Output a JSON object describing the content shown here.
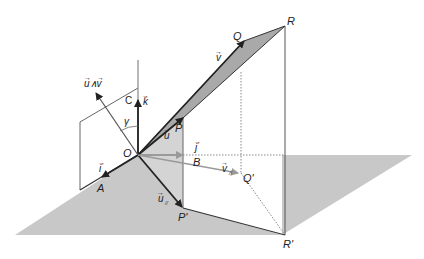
{
  "figure": {
    "type": "3d-vector-geometry"
  },
  "colors": {
    "plane_fill": "#c8c8c8",
    "parallelogram_fill": "#a9a9a9",
    "projection_fill": "#d4d4d4",
    "line_dark": "#222222",
    "line_gray": "#888888",
    "arrow_gray": "#9a9a9a"
  },
  "points": {
    "O": "O",
    "A": "A",
    "B": "B",
    "C": "C",
    "P": "P",
    "Q": "Q",
    "R": "R",
    "P_prime": "P'",
    "Q_prime": "Q'",
    "R_prime": "R'"
  },
  "vectors": {
    "u": "u",
    "v": "v",
    "i": "i",
    "j": "j",
    "k": "k",
    "u_par": "u",
    "u_par_sub": "//",
    "v_par": "v",
    "v_par_sub": "//",
    "cross": "u∧v"
  },
  "angles": {
    "gamma": "γ"
  }
}
